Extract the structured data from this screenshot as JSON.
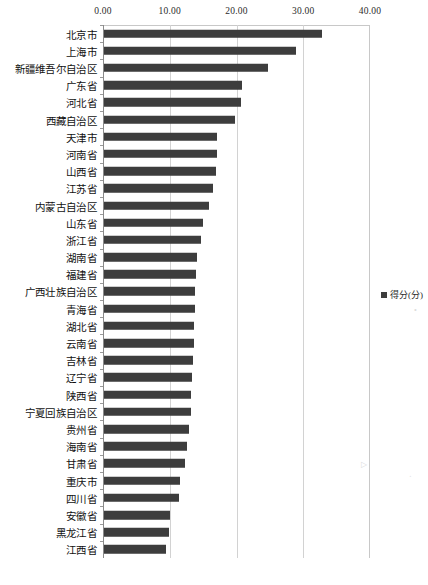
{
  "chart_data": {
    "type": "bar",
    "orientation": "horizontal",
    "title": "",
    "xlabel": "",
    "ylabel": "",
    "xlim": [
      0,
      40
    ],
    "grid": true,
    "legend_position": "right",
    "legend": [
      "得分(分)"
    ],
    "xticks": [
      "0.00",
      "10.00",
      "20.00",
      "30.00",
      "40.00"
    ],
    "xtick_values": [
      0,
      10,
      20,
      30,
      40
    ],
    "series_name": "得分(分)",
    "bar_color": "#3d3d3d",
    "categories": [
      "北京市",
      "上海市",
      "新疆维吾尔自治区",
      "广东省",
      "河北省",
      "西藏自治区",
      "天津市",
      "河南省",
      "山西省",
      "江苏省",
      "内蒙古自治区",
      "山东省",
      "浙江省",
      "湖南省",
      "福建省",
      "广西壮族自治区",
      "青海省",
      "湖北省",
      "云南省",
      "吉林省",
      "辽宁省",
      "陕西省",
      "宁夏回族自治区",
      "贵州省",
      "海南省",
      "甘肃省",
      "重庆市",
      "四川省",
      "安徽省",
      "黑龙江省",
      "江西省"
    ],
    "values": [
      32.7,
      28.8,
      24.6,
      20.6,
      20.5,
      19.7,
      16.9,
      16.9,
      16.8,
      16.3,
      15.8,
      14.8,
      14.6,
      13.9,
      13.8,
      13.7,
      13.6,
      13.5,
      13.5,
      13.3,
      13.2,
      13.1,
      13.0,
      12.7,
      12.4,
      12.2,
      11.4,
      11.3,
      9.9,
      9.7,
      9.3
    ]
  },
  "legend": {
    "label": "得分(分)"
  }
}
